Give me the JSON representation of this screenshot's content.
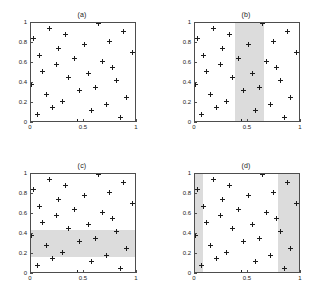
{
  "figure": {
    "panel_count": 4,
    "marker_symbol": "+",
    "marker_color": "#1c1c1c",
    "shade_color": "#dcdcdc",
    "axis_color": "#4d4d4d",
    "background": "#ffffff"
  },
  "axis": {
    "xlim": [
      0,
      1
    ],
    "ylim": [
      0,
      1
    ],
    "xticks": [
      0,
      0.5,
      1
    ],
    "yticks": [
      0,
      0.2,
      0.4,
      0.6,
      0.8,
      1
    ],
    "xticklabels": [
      "0",
      "0.5",
      "1"
    ],
    "yticklabels": [
      "0",
      "0.2",
      "0.4",
      "0.6",
      "0.8",
      "1"
    ],
    "grid": false
  },
  "points": [
    [
      0.0,
      0.39
    ],
    [
      0.02,
      0.85
    ],
    [
      0.06,
      0.09
    ],
    [
      0.08,
      0.68
    ],
    [
      0.11,
      0.52
    ],
    [
      0.15,
      0.29
    ],
    [
      0.17,
      0.95
    ],
    [
      0.2,
      0.16
    ],
    [
      0.24,
      0.59
    ],
    [
      0.26,
      0.75
    ],
    [
      0.3,
      0.22
    ],
    [
      0.33,
      0.89
    ],
    [
      0.35,
      0.46
    ],
    [
      0.41,
      0.65
    ],
    [
      0.44,
      0.02
    ],
    [
      0.46,
      0.33
    ],
    [
      0.5,
      0.79
    ],
    [
      0.54,
      0.5
    ],
    [
      0.57,
      0.13
    ],
    [
      0.61,
      0.36
    ],
    [
      0.64,
      1.0
    ],
    [
      0.67,
      0.62
    ],
    [
      0.71,
      0.19
    ],
    [
      0.74,
      0.82
    ],
    [
      0.77,
      0.56
    ],
    [
      0.81,
      0.43
    ],
    [
      0.84,
      0.06
    ],
    [
      0.87,
      0.92
    ],
    [
      0.9,
      0.26
    ],
    [
      0.96,
      0.71
    ]
  ],
  "chart_data": {
    "type": "scatter",
    "title": "",
    "xlabel": "",
    "ylabel": "",
    "xlim": [
      0,
      1
    ],
    "ylim": [
      0,
      1
    ],
    "grid": false,
    "legend": null,
    "marker": "+",
    "panels": [
      {
        "id": "a",
        "title": "(a)",
        "shaded_regions": []
      },
      {
        "id": "b",
        "title": "(b)",
        "shaded_regions": [
          {
            "orientation": "vertical",
            "x0": 0.38,
            "x1": 0.65,
            "y0": 0.0,
            "y1": 1.0
          }
        ]
      },
      {
        "id": "c",
        "title": "(c)",
        "shaded_regions": [
          {
            "orientation": "horizontal",
            "x0": 0.0,
            "x1": 1.0,
            "y0": 0.17,
            "y1": 0.44
          }
        ]
      },
      {
        "id": "d",
        "title": "(d)",
        "shaded_regions": [
          {
            "orientation": "vertical",
            "x0": 0.0,
            "x1": 0.08,
            "y0": 0.0,
            "y1": 1.0
          },
          {
            "orientation": "vertical",
            "x0": 0.78,
            "x1": 1.0,
            "y0": 0.0,
            "y1": 1.0
          }
        ]
      }
    ],
    "x": [
      0.0,
      0.02,
      0.06,
      0.08,
      0.11,
      0.15,
      0.17,
      0.2,
      0.24,
      0.26,
      0.3,
      0.33,
      0.35,
      0.41,
      0.44,
      0.46,
      0.5,
      0.54,
      0.57,
      0.61,
      0.64,
      0.67,
      0.71,
      0.74,
      0.77,
      0.81,
      0.84,
      0.87,
      0.9,
      0.96
    ],
    "y": [
      0.39,
      0.85,
      0.09,
      0.68,
      0.52,
      0.29,
      0.95,
      0.16,
      0.59,
      0.75,
      0.22,
      0.89,
      0.46,
      0.65,
      0.02,
      0.33,
      0.79,
      0.5,
      0.13,
      0.36,
      1.0,
      0.62,
      0.19,
      0.82,
      0.56,
      0.43,
      0.06,
      0.92,
      0.26,
      0.71
    ]
  }
}
